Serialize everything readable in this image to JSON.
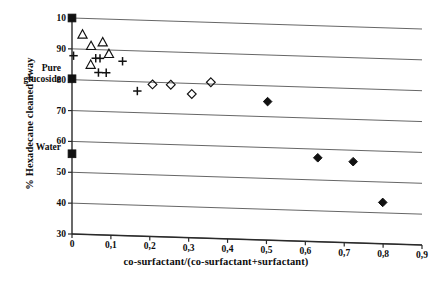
{
  "chart_data": {
    "type": "scatter",
    "title": "",
    "xlabel": "co-surfactant/(co-surfactant+surfactant)",
    "ylabel": "% Hexadecane cleaned away",
    "xlim": [
      0,
      0.9
    ],
    "ylim": [
      30,
      100
    ],
    "grid": true,
    "legend_position": "none",
    "xticks": [
      "0",
      "0,1",
      "0,2",
      "0,3",
      "0,4",
      "0,5",
      "0,6",
      "0,7",
      "0,8",
      "0,9"
    ],
    "xtick_values": [
      0,
      0.1,
      0.2,
      0.3,
      0.4,
      0.5,
      0.6,
      0.7,
      0.8,
      0.9
    ],
    "yticks": [
      "30",
      "40",
      "50",
      "60",
      "70",
      "80",
      "90",
      "10"
    ],
    "ytick_values": [
      30,
      40,
      50,
      60,
      70,
      80,
      90,
      100
    ],
    "ytick_top_note": "top label is clipped in the original scan; the gridline is 100",
    "annotations": [
      {
        "text": "Pure\nglucoside",
        "line1": "Pure",
        "line2": "glucoside",
        "x": 0,
        "y": 80
      },
      {
        "text": "Water",
        "line1": "Water",
        "line2": "",
        "x": 0,
        "y": 56
      }
    ],
    "series": [
      {
        "name": "reference points",
        "marker": "filled-square",
        "points": [
          {
            "x": 0.0,
            "y": 100.0
          },
          {
            "x": 0.0,
            "y": 80.3
          },
          {
            "x": 0.0,
            "y": 56.0
          }
        ]
      },
      {
        "name": "open triangles",
        "marker": "open-triangle",
        "points": [
          {
            "x": 0.027,
            "y": 94.8
          },
          {
            "x": 0.049,
            "y": 91.2
          },
          {
            "x": 0.079,
            "y": 92.5
          },
          {
            "x": 0.095,
            "y": 88.8
          },
          {
            "x": 0.048,
            "y": 85.1
          }
        ]
      },
      {
        "name": "plus signs",
        "marker": "plus",
        "points": [
          {
            "x": 0.004,
            "y": 87.8
          },
          {
            "x": 0.061,
            "y": 87.2
          },
          {
            "x": 0.072,
            "y": 87.2
          },
          {
            "x": 0.13,
            "y": 86.5
          },
          {
            "x": 0.068,
            "y": 82.6
          },
          {
            "x": 0.088,
            "y": 82.6
          },
          {
            "x": 0.168,
            "y": 77.0
          }
        ]
      },
      {
        "name": "open diamonds",
        "marker": "open-diamond",
        "points": [
          {
            "x": 0.207,
            "y": 79.3
          },
          {
            "x": 0.254,
            "y": 79.4
          },
          {
            "x": 0.308,
            "y": 76.6
          },
          {
            "x": 0.357,
            "y": 80.6
          }
        ]
      },
      {
        "name": "filled diamonds",
        "marker": "filled-diamond",
        "points": [
          {
            "x": 0.503,
            "y": 74.9
          },
          {
            "x": 0.632,
            "y": 57.2
          },
          {
            "x": 0.723,
            "y": 56.3
          },
          {
            "x": 0.799,
            "y": 43.4
          }
        ]
      }
    ],
    "style": {
      "grid_color": "#555555",
      "axis_color": "#2a2a2a",
      "marker_color": "#111111",
      "background": "#ffffff",
      "grid_skew_note": "gridlines tilt slightly downward to the right (scan artifact)"
    }
  }
}
